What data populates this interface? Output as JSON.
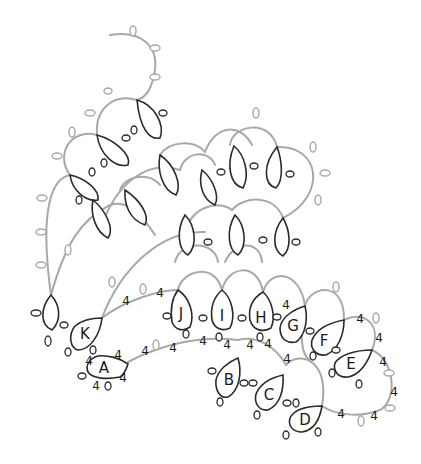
{
  "diagram": {
    "type": "tatting-pattern",
    "colors": {
      "chain": "#a8a8a8",
      "ring": "#2a2a2a",
      "background": "#ffffff"
    },
    "ring_labels": [
      {
        "id": "A",
        "x": 104,
        "y": 368
      },
      {
        "id": "B",
        "x": 231,
        "y": 378
      },
      {
        "id": "C",
        "x": 269,
        "y": 394
      },
      {
        "id": "D",
        "x": 305,
        "y": 420
      },
      {
        "id": "E",
        "x": 351,
        "y": 364
      },
      {
        "id": "F",
        "x": 323,
        "y": 341
      },
      {
        "id": "G",
        "x": 293,
        "y": 325
      },
      {
        "id": "H",
        "x": 261,
        "y": 318
      },
      {
        "id": "I",
        "x": 222,
        "y": 316
      },
      {
        "id": "J",
        "x": 181,
        "y": 314
      },
      {
        "id": "K",
        "x": 85,
        "y": 333
      }
    ],
    "stitch_counts": [
      {
        "label": "4",
        "x": 126,
        "y": 301
      },
      {
        "label": "4",
        "x": 160,
        "y": 293
      },
      {
        "label": "4",
        "x": 89,
        "y": 361
      },
      {
        "label": "4",
        "x": 118,
        "y": 355
      },
      {
        "label": "4",
        "x": 123,
        "y": 378
      },
      {
        "label": "4",
        "x": 96,
        "y": 386
      },
      {
        "label": "4",
        "x": 145,
        "y": 351
      },
      {
        "label": "4",
        "x": 173,
        "y": 348
      },
      {
        "label": "4",
        "x": 203,
        "y": 341
      },
      {
        "label": "4",
        "x": 227,
        "y": 345
      },
      {
        "label": "4",
        "x": 250,
        "y": 345
      },
      {
        "label": "4",
        "x": 268,
        "y": 344
      },
      {
        "label": "4",
        "x": 286,
        "y": 305
      },
      {
        "label": "4",
        "x": 287,
        "y": 359
      },
      {
        "label": "4",
        "x": 360,
        "y": 319
      },
      {
        "label": "4",
        "x": 379,
        "y": 338
      },
      {
        "label": "4",
        "x": 383,
        "y": 362
      },
      {
        "label": "4",
        "x": 394,
        "y": 392
      },
      {
        "label": "4",
        "x": 341,
        "y": 414
      },
      {
        "label": "4",
        "x": 374,
        "y": 416
      }
    ]
  }
}
